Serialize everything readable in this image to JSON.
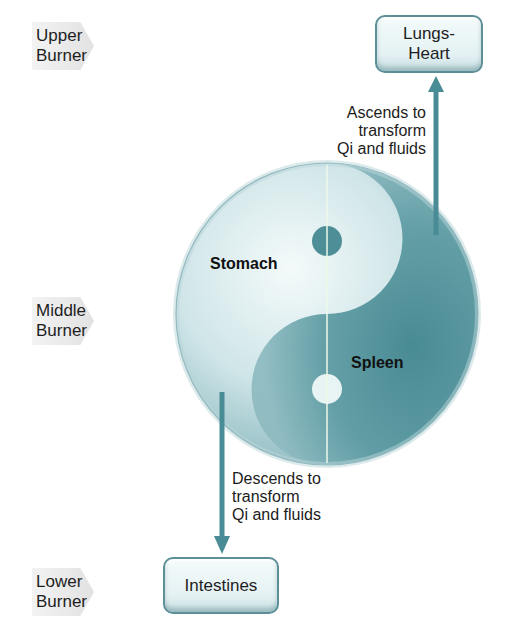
{
  "burners": [
    {
      "label": "Upper\nBurner",
      "line1": "Upper",
      "line2": "Burner"
    },
    {
      "label": "Middle\nBurner",
      "line1": "Middle",
      "line2": "Burner"
    },
    {
      "label": "Lower\nBurner",
      "line1": "Lower",
      "line2": "Burner"
    }
  ],
  "boxes": {
    "top": {
      "line1": "Lungs-",
      "line2": "Heart"
    },
    "bottom": {
      "line1": "Intestines"
    }
  },
  "yin_yang": {
    "left_label": "Stomach",
    "right_label": "Spleen"
  },
  "arrows": {
    "ascend": {
      "line1": "Ascends to",
      "line2": "transform",
      "line3": "Qi and fluids"
    },
    "descend": {
      "line1": "Descends to",
      "line2": "transform",
      "line3": "Qi and fluids"
    }
  },
  "colors": {
    "arrow": "#4a8c96",
    "teal_dark": "#4f8f97",
    "teal_light": "#e6f2f3"
  }
}
